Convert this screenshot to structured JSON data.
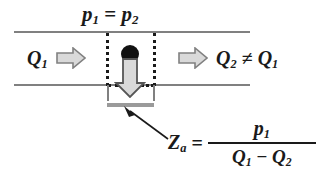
{
  "figure": {
    "labels": {
      "pressure_equality": {
        "p_left": "p",
        "p_left_sub": "1",
        "equals": "=",
        "p_right": "p",
        "p_right_sub": "2"
      },
      "flow_in": {
        "symbol": "Q",
        "sub": "1"
      },
      "flow_out": {
        "symbol_left": "Q",
        "sub_left": "2",
        "relation": "≠",
        "symbol_right": "Q",
        "sub_right": "1"
      },
      "impedance": {
        "symbol": "Z",
        "sub": "a",
        "equals": "=",
        "numerator_symbol": "p",
        "numerator_sub": "1",
        "denominator_left_symbol": "Q",
        "denominator_left_sub": "1",
        "denominator_operator": "−",
        "denominator_right_symbol": "Q",
        "denominator_right_sub": "2"
      }
    },
    "icons": {
      "flow_in_arrow": "right-block-arrow-icon",
      "flow_out_arrow": "right-block-arrow-icon",
      "branch_flow_arrow": "down-block-arrow-icon",
      "leader_arrow": "leader-arrow-icon",
      "junction_node": "filled-circle-node-icon"
    },
    "colors": {
      "text": "#1a1a1a",
      "pipe_wall": "#808080",
      "arrow_fill": "#d9d9d9",
      "arrow_stroke": "#808080",
      "dotted_line": "#1a1a1a",
      "impedance_bar": "#9a9a9a",
      "node_fill": "#111111",
      "background": "#ffffff"
    }
  }
}
